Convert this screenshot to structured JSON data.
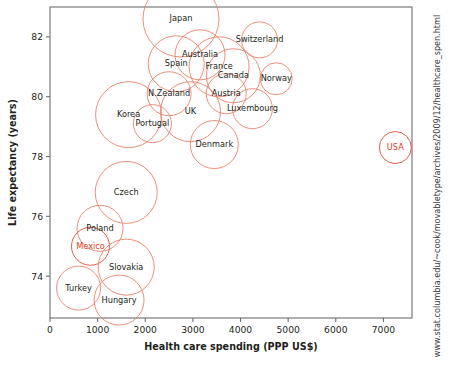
{
  "chart_data": {
    "type": "scatter",
    "title": "",
    "xlabel": "Health care spending (PPP US$)",
    "ylabel": "Life expectancy (years)",
    "xlim": [
      0,
      7600
    ],
    "ylim": [
      72.6,
      83.0
    ],
    "xticks": [
      0,
      1000,
      2000,
      3000,
      4000,
      5000,
      6000,
      7000
    ],
    "xticklabels": [
      "0",
      "1000",
      "2000",
      "3000",
      "4000",
      "5000",
      "6000",
      "7000"
    ],
    "yticks": [
      74,
      76,
      78,
      80,
      82
    ],
    "yticklabels": [
      "74",
      "76",
      "78",
      "80",
      "82"
    ],
    "grid": false,
    "legend": false,
    "marker": "open-circle",
    "size_meaning": "bubble-area",
    "bubble_color": "#e8836b",
    "highlight_color": "#e03a25",
    "points": [
      {
        "label": "Japan",
        "x": 2750,
        "y": 82.6,
        "r": 38,
        "highlight": false
      },
      {
        "label": "Switzerland",
        "x": 4400,
        "y": 81.9,
        "r": 18,
        "highlight": false
      },
      {
        "label": "Australia",
        "x": 3150,
        "y": 81.4,
        "r": 25,
        "highlight": false
      },
      {
        "label": "Spain",
        "x": 2650,
        "y": 81.1,
        "r": 28,
        "highlight": false
      },
      {
        "label": "France",
        "x": 3550,
        "y": 81.0,
        "r": 30,
        "highlight": false
      },
      {
        "label": "Canada",
        "x": 3850,
        "y": 80.7,
        "r": 27,
        "highlight": false
      },
      {
        "label": "Norway",
        "x": 4750,
        "y": 80.6,
        "r": 16,
        "highlight": false
      },
      {
        "label": "N.Zealand",
        "x": 2500,
        "y": 80.1,
        "r": 22,
        "highlight": false
      },
      {
        "label": "Austria",
        "x": 3700,
        "y": 80.1,
        "r": 20,
        "highlight": false
      },
      {
        "label": "UK",
        "x": 2950,
        "y": 79.5,
        "r": 30,
        "highlight": false
      },
      {
        "label": "Korea",
        "x": 1650,
        "y": 79.4,
        "r": 33,
        "highlight": false
      },
      {
        "label": "Portugal",
        "x": 2150,
        "y": 79.1,
        "r": 19,
        "highlight": false
      },
      {
        "label": "Luxembourg",
        "x": 4250,
        "y": 79.6,
        "r": 20,
        "highlight": false
      },
      {
        "label": "Denmark",
        "x": 3450,
        "y": 78.4,
        "r": 24,
        "highlight": false
      },
      {
        "label": "USA",
        "x": 7250,
        "y": 78.3,
        "r": 16,
        "highlight": true
      },
      {
        "label": "Czech",
        "x": 1600,
        "y": 76.8,
        "r": 31,
        "highlight": false
      },
      {
        "label": "Poland",
        "x": 1050,
        "y": 75.6,
        "r": 23,
        "highlight": false
      },
      {
        "label": "Mexico",
        "x": 850,
        "y": 75.0,
        "r": 19,
        "highlight": true
      },
      {
        "label": "Slovakia",
        "x": 1600,
        "y": 74.3,
        "r": 28,
        "highlight": false
      },
      {
        "label": "Turkey",
        "x": 600,
        "y": 73.6,
        "r": 22,
        "highlight": false
      },
      {
        "label": "Hungary",
        "x": 1450,
        "y": 73.2,
        "r": 25,
        "highlight": false
      }
    ]
  },
  "source": {
    "url": "www.stat.columbia.edu/~cook/movabletype/archives/2009/12/healthcare_spen.html"
  }
}
